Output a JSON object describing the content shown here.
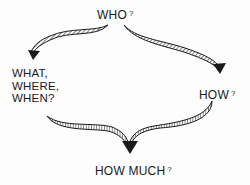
{
  "diagram": {
    "nodes": {
      "top": {
        "text": "WHO",
        "mark": "?"
      },
      "left": {
        "lines": [
          "WHAT,",
          "WHERE,",
          "WHEN?"
        ]
      },
      "right": {
        "text": "HOW",
        "mark": "?"
      },
      "bottom": {
        "text": "HOW MUCH",
        "mark": "?"
      }
    },
    "edges": [
      {
        "from": "top",
        "to": "left",
        "style": "hatched curved arrow"
      },
      {
        "from": "top",
        "to": "right",
        "style": "hatched curved arrow"
      },
      {
        "from": "left",
        "to": "bottom",
        "style": "hatched curved arrow (merging)"
      },
      {
        "from": "right",
        "to": "bottom",
        "style": "hatched curved arrow (merging)"
      }
    ],
    "colors": {
      "ink": "#1a1a1a",
      "background": "#fdfdfd"
    }
  }
}
